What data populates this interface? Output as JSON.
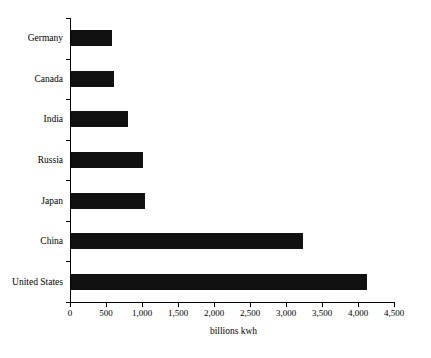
{
  "clipped_title": "",
  "chart_data": {
    "type": "bar",
    "orientation": "horizontal",
    "title": "",
    "xlabel": "billions kwh",
    "ylabel": "",
    "categories": [
      "Germany",
      "Canada",
      "India",
      "Russia",
      "Japan",
      "China",
      "United States"
    ],
    "values": [
      570,
      600,
      790,
      1000,
      1030,
      3220,
      4110
    ],
    "xlim": [
      0,
      4500
    ],
    "xticks": [
      0,
      500,
      1000,
      1500,
      2000,
      2500,
      3000,
      3500,
      4000,
      4500
    ],
    "xtick_labels": [
      "0",
      "500",
      "1,000",
      "1,500",
      "2,000",
      "2,500",
      "3,000",
      "3,500",
      "4,000",
      "4,500"
    ],
    "grid": false,
    "legend": false,
    "bar_color": "#111111",
    "axis_color": "#000000",
    "background_color": "#ffffff"
  }
}
